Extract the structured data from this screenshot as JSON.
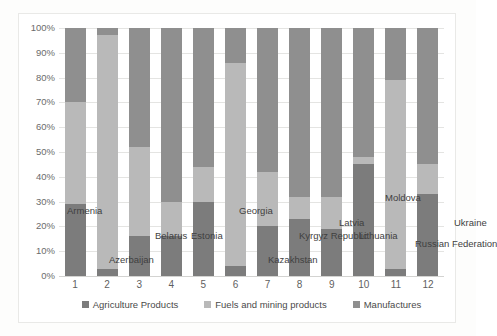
{
  "chart_data": {
    "type": "bar",
    "subtype": "stacked-100-percent",
    "title": "",
    "xlabel": "",
    "ylabel": "",
    "ylim": [
      0,
      100
    ],
    "grid": true,
    "legend_position": "bottom",
    "categories": [
      "1",
      "2",
      "3",
      "4",
      "5",
      "6",
      "7",
      "8",
      "9",
      "10",
      "11",
      "12"
    ],
    "category_names": [
      "Armenia",
      "Azerbaijan",
      "Belarus",
      "Estonia",
      "Georgia",
      "Kazakhstan",
      "Kyrgyz Republic",
      "Latvia",
      "Lithuania",
      "Moldova",
      "Russian Federation",
      "Ukraine"
    ],
    "ytick_labels": [
      "100%",
      "90%",
      "80%",
      "70%",
      "60%",
      "50%",
      "40%",
      "30%",
      "20%",
      "10%",
      "0%"
    ],
    "ytick_values": [
      100,
      90,
      80,
      70,
      60,
      50,
      40,
      30,
      20,
      10,
      0
    ],
    "series": [
      {
        "name": "Agriculture Products",
        "color": "#7c7c7c",
        "values": [
          29,
          3,
          16,
          16,
          30,
          4,
          20,
          23,
          19,
          45,
          3,
          33
        ]
      },
      {
        "name": "Fuels and mining products",
        "color": "#b9b9b9",
        "values": [
          41,
          94,
          36,
          14,
          14,
          82,
          22,
          9,
          13,
          3,
          76,
          12
        ]
      },
      {
        "name": "Manufactures",
        "color": "#8f8f8f",
        "values": [
          30,
          3,
          48,
          70,
          56,
          14,
          58,
          68,
          68,
          52,
          21,
          55
        ]
      }
    ]
  },
  "annotations": {
    "country_labels": [
      {
        "text": "Armenia",
        "x": 8,
        "y": 177
      },
      {
        "text": "Azerbaijan",
        "x": 50,
        "y": 226
      },
      {
        "text": "Belarus",
        "x": 96,
        "y": 202
      },
      {
        "text": "Estonia",
        "x": 132,
        "y": 202
      },
      {
        "text": "Georgia",
        "x": 180,
        "y": 177
      },
      {
        "text": "Kazakhstan",
        "x": 209,
        "y": 226
      },
      {
        "text": "Kyrgyz Republic",
        "x": 240,
        "y": 202
      },
      {
        "text": "Latvia",
        "x": 280,
        "y": 189
      },
      {
        "text": "Lithuania",
        "x": 300,
        "y": 202
      },
      {
        "text": "Moldova",
        "x": 326,
        "y": 164
      },
      {
        "text": "Russian Federation",
        "x": 356,
        "y": 210
      },
      {
        "text": "Ukraine",
        "x": 395,
        "y": 189
      }
    ]
  },
  "legend": {
    "items": [
      {
        "label": "Agriculture Products",
        "color": "#7c7c7c"
      },
      {
        "label": "Fuels and mining products",
        "color": "#b9b9b9"
      },
      {
        "label": "Manufactures",
        "color": "#8f8f8f"
      }
    ]
  }
}
